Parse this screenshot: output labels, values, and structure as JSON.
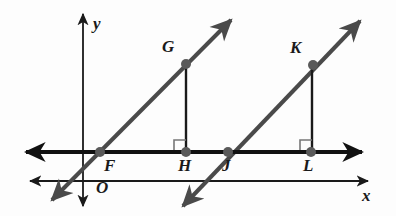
{
  "figure": {
    "background_color": "#fdfdfd",
    "ink_color": "#2b2b2b",
    "axis_color": "#1a1a1a",
    "transversal_color": "#4a4a4a",
    "point_color": "#5a5a5a"
  },
  "axes": {
    "y_axis": {
      "label": "y",
      "label_x": 93,
      "label_y": 15,
      "x": 83,
      "top_y": 14,
      "bottom_y": 206
    },
    "x_axis": {
      "label": "x",
      "label_x": 362,
      "label_y": 187,
      "y": 181,
      "left_x": 30,
      "right_x": 368
    },
    "origin": {
      "label": "O",
      "label_x": 96,
      "label_y": 179
    }
  },
  "horizontal_line": {
    "name": "line-FHJL",
    "y": 152,
    "left_x": 26,
    "right_x": 362,
    "stroke_width": 4.2
  },
  "points": [
    {
      "id": "F",
      "label": "F",
      "x": 100,
      "y": 152,
      "label_x": 104,
      "label_y": 157,
      "radius": 5.0
    },
    {
      "id": "G",
      "label": "G",
      "x": 186,
      "y": 64,
      "label_x": 162,
      "label_y": 38,
      "radius": 5.0
    },
    {
      "id": "H",
      "label": "H",
      "x": 186,
      "y": 152,
      "label_x": 178,
      "label_y": 157,
      "radius": 5.0
    },
    {
      "id": "J",
      "label": "J",
      "x": 228,
      "y": 152,
      "label_x": 222,
      "label_y": 157,
      "radius": 5.0
    },
    {
      "id": "K",
      "label": "K",
      "x": 313,
      "y": 65,
      "label_x": 290,
      "label_y": 39,
      "radius": 5.0
    },
    {
      "id": "L",
      "label": "L",
      "x": 311,
      "y": 152,
      "label_x": 303,
      "label_y": 157,
      "radius": 5.0
    }
  ],
  "transversals": [
    {
      "name": "line-through-F-G",
      "start_x": 52,
      "start_y": 200,
      "end_x": 231,
      "end_y": 20,
      "stroke_width": 4.0
    },
    {
      "name": "line-through-J-K",
      "start_x": 183,
      "start_y": 206,
      "end_x": 360,
      "end_y": 21,
      "stroke_width": 4.0
    }
  ],
  "perpendicular_segments": [
    {
      "name": "segment-GH",
      "x": 186,
      "top_y": 64,
      "bottom_y": 152,
      "stroke_width": 2.4
    },
    {
      "name": "segment-KL",
      "x": 312,
      "top_y": 65,
      "bottom_y": 152,
      "stroke_width": 2.4
    }
  ],
  "right_angle_marks": [
    {
      "name": "right-angle-at-H",
      "x": 174,
      "y": 140,
      "size": 12
    },
    {
      "name": "right-angle-at-L",
      "x": 300,
      "y": 140,
      "size": 12
    }
  ],
  "label_font_size": 17
}
